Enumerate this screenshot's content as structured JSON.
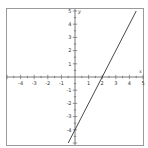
{
  "chart_data": {
    "type": "line",
    "title": "",
    "xlabel": "x",
    "ylabel": "y",
    "xlim": [
      -5,
      5
    ],
    "ylim": [
      -5,
      5
    ],
    "grid": false,
    "legend": null,
    "x_ticks": [
      -4,
      -3,
      -2,
      -1,
      1,
      2,
      3,
      4,
      5
    ],
    "y_ticks": [
      5,
      4,
      3,
      2,
      1,
      -1,
      -2,
      -3,
      -4
    ],
    "series": [
      {
        "name": "y = 2x - 4",
        "equation": "y = 2x - 4",
        "x": [
          -0.5,
          4.5
        ],
        "y": [
          -5,
          5
        ]
      }
    ]
  },
  "colors": {
    "frame": "#9a9a9a",
    "axis": "#555555",
    "line": "#333333",
    "background": "#ffffff"
  }
}
